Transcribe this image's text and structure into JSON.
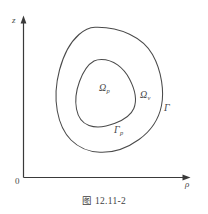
{
  "figure": {
    "caption": "图 12.11-2",
    "axes": {
      "vertical_label": "z",
      "horizontal_label": "ρ",
      "origin_label": "0"
    },
    "labels": {
      "inner_region": "Ω",
      "inner_region_sub": "p",
      "outer_region": "Ω",
      "outer_region_sub": "v",
      "inner_boundary": "Γ",
      "inner_boundary_sub": "p",
      "outer_boundary": "Γ"
    },
    "colors": {
      "curve": "#4a4a4a",
      "axis": "#3a3a3a",
      "background": "#ffffff",
      "text": "#4a4a4a"
    }
  }
}
